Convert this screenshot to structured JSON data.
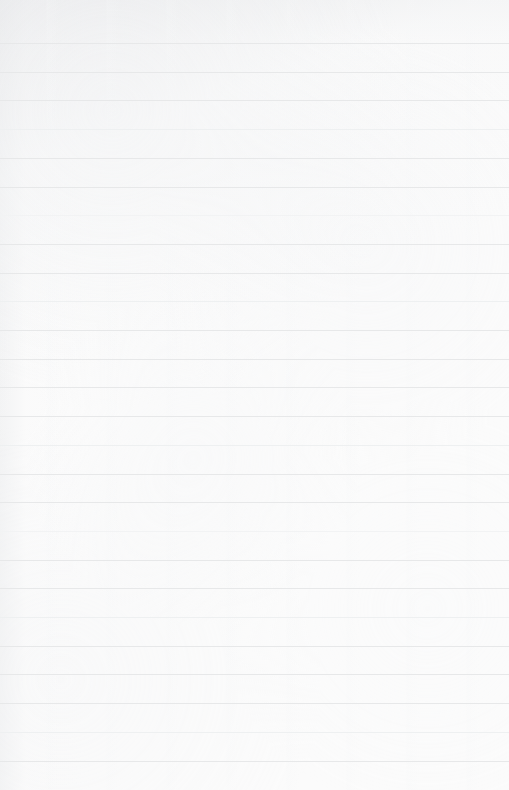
{
  "page": {
    "kind": "blank-ruled-notebook-paper",
    "width": 509,
    "height": 790,
    "text_content": "",
    "handwriting": "",
    "headings": [],
    "annotations": []
  },
  "colors": {
    "paper": "#fbfbfb",
    "rule": "#e7e8e9",
    "rule_faint": "#eef0f1",
    "shadow_edge": "#e4e5e7"
  },
  "ruling": {
    "line_count": 26,
    "first_line_y": 43,
    "spacing": 28.7,
    "line_thickness": 1,
    "full_bleed": true,
    "has_margin_line": false,
    "lines_y": [
      43,
      71.7,
      100.4,
      129.1,
      157.8,
      186.5,
      215.2,
      243.9,
      272.6,
      301.3,
      330.0,
      358.7,
      387.4,
      416.1,
      444.8,
      473.5,
      502.2,
      530.9,
      559.6,
      588.3,
      617.0,
      645.7,
      674.4,
      703.1,
      731.8,
      760.5
    ],
    "faint_indices": [
      3,
      9,
      14,
      20,
      24
    ],
    "fainter_indices": [
      6,
      17
    ]
  }
}
